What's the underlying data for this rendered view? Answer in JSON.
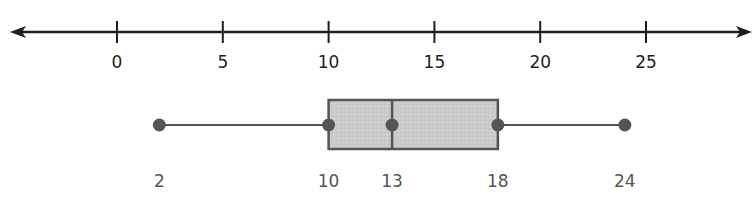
{
  "chart_data": {
    "type": "boxplot",
    "title": "",
    "xlabel": "",
    "ylabel": "",
    "axis": {
      "type": "number-line",
      "arrows": "both",
      "ticks": [
        0,
        5,
        10,
        15,
        20,
        25
      ],
      "tick_labels": [
        "0",
        "5",
        "10",
        "15",
        "20",
        "25"
      ],
      "range": [
        -5,
        30
      ]
    },
    "grid": false,
    "legend": null,
    "five_number_summary": {
      "min": 2,
      "q1": 10,
      "median": 13,
      "q3": 18,
      "max": 24
    },
    "value_labels": [
      "2",
      "10",
      "13",
      "18",
      "24"
    ]
  },
  "colors": {
    "axis": "#1e1e1e",
    "box_fill": "#c8c8c8",
    "box_stroke": "#555555",
    "point": "#555555",
    "value_label": "#555555"
  }
}
